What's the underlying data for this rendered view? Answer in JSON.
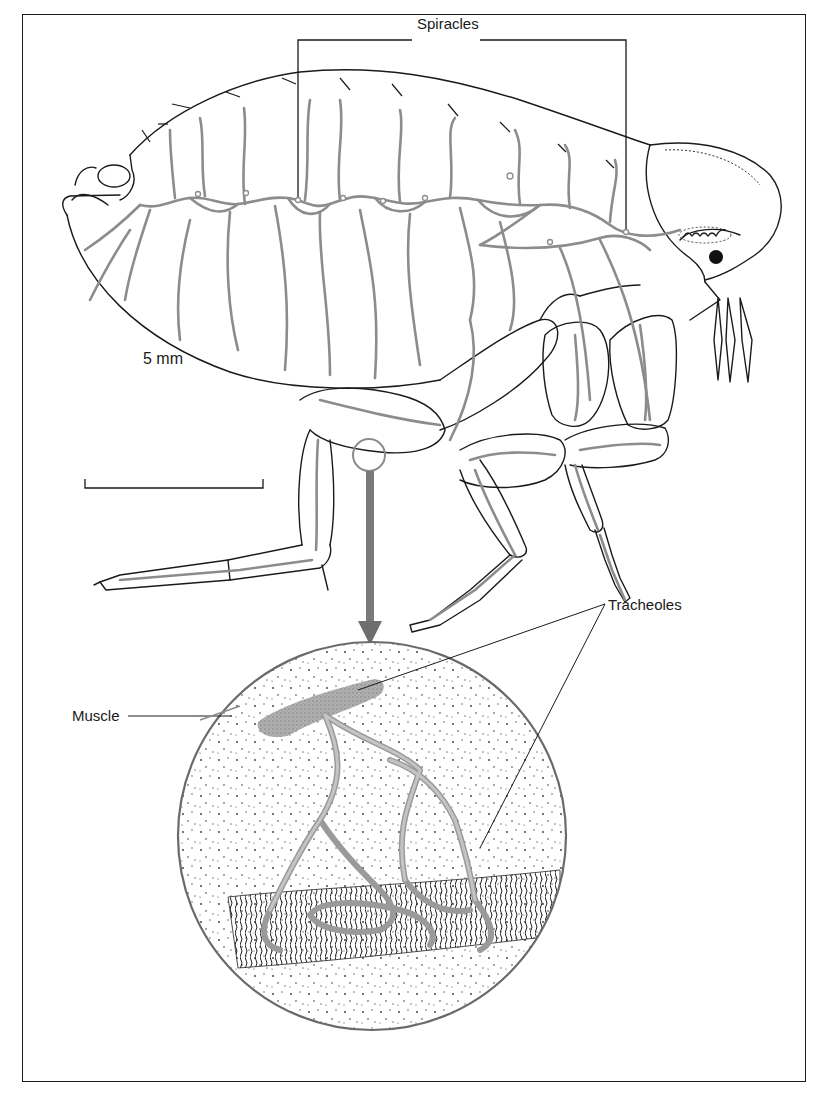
{
  "figure": {
    "colors": {
      "outline": "#1a1a1a",
      "trachea": "#8c8c8c",
      "arrow": "#777777",
      "frame": "#1a1a1a",
      "background": "#ffffff"
    }
  },
  "labels": {
    "spiracles": "Spiracles",
    "scale_bar": "5 mm",
    "tracheoles": "Tracheoles",
    "muscle": "Muscle"
  },
  "scale_bar": {
    "length_label": "5 mm"
  },
  "icons": {
    "magnify_arrow": "down-arrow-icon"
  }
}
